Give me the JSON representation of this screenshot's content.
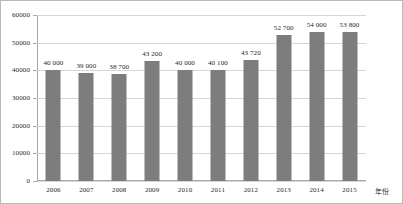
{
  "chart_data": {
    "type": "bar",
    "title": "",
    "xlabel": "年份",
    "ylabel": "",
    "categories": [
      "2006",
      "2007",
      "2008",
      "2009",
      "2010",
      "2011",
      "2012",
      "2013",
      "2014",
      "2015"
    ],
    "values": [
      40000,
      39000,
      38700,
      43200,
      40000,
      40100,
      43720,
      52700,
      54000,
      53800
    ],
    "data_labels": [
      "40 000",
      "39 000",
      "38 700",
      "43 200",
      "40 000",
      "40 100",
      "43 720",
      "52 700",
      "54 000",
      "53 800"
    ],
    "ylim": [
      0,
      60000
    ],
    "yticks": [
      0,
      10000,
      20000,
      30000,
      40000,
      50000,
      60000
    ],
    "ytick_labels": [
      "0",
      "10000",
      "20000",
      "30000",
      "40000",
      "50000",
      "60000"
    ],
    "grid": true,
    "legend": false,
    "series": [
      {
        "name": "",
        "color": "#7d7d7d",
        "values": [
          40000,
          39000,
          38700,
          43200,
          40000,
          40100,
          43720,
          52700,
          54000,
          53800
        ]
      }
    ],
    "colors": {
      "bar": "#7d7d7d",
      "gridline": "#d6d6d6",
      "axis": "#a8a8a8",
      "frame": "#b9b9b9",
      "text": "#2b2b2b",
      "background": "#ffffff"
    }
  }
}
